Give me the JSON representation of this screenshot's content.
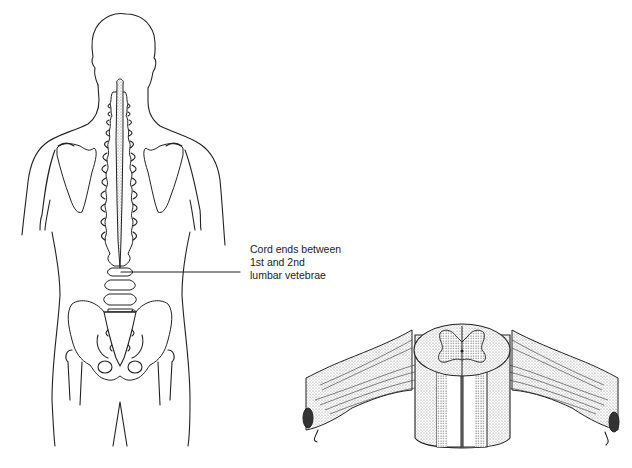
{
  "figure": {
    "panels": [
      {
        "id": "back-view",
        "description": "Posterior view of human torso showing spinal column and spinal cord"
      },
      {
        "id": "cord-section",
        "description": "Segment of spinal cord in cross-section with nerve roots"
      }
    ],
    "annotation": {
      "lines": [
        "Cord ends between",
        "1st and 2nd",
        "lumbar vetebrae"
      ]
    }
  }
}
